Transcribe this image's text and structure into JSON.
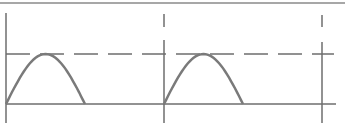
{
  "diagram": {
    "colors": {
      "frame": "#8a8a8a",
      "wave": "#7a7a7a",
      "axis": "#6e6e6e",
      "background": "#ffffff"
    },
    "waveform": {
      "type": "half-wave-rectified-sine",
      "periods_shown": 2,
      "conduction_fraction_of_period": 0.5
    },
    "markers": {
      "peak_level": "dashed",
      "baseline": "solid",
      "period_boundaries": 3
    }
  }
}
